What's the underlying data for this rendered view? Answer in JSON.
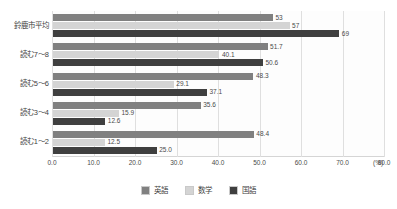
{
  "chart_data": {
    "type": "bar",
    "orientation": "horizontal",
    "title": "",
    "xlabel": "(%)",
    "ylabel": "",
    "xlim": [
      0.0,
      80.0
    ],
    "xticks": [
      "0.0",
      "10.0",
      "20.0",
      "30.0",
      "40.0",
      "50.0",
      "60.0",
      "70.0",
      "80.0"
    ],
    "xtick_values": [
      0.0,
      10.0,
      20.0,
      30.0,
      40.0,
      50.0,
      60.0,
      70.0,
      80.0
    ],
    "grid": true,
    "legend_position": "bottom",
    "categories": [
      "鈴鹿市平均",
      "読む7〜8",
      "読む5〜6",
      "読む3〜4",
      "読む1〜2"
    ],
    "series": [
      {
        "name": "英語",
        "color": "#808080",
        "values": [
          53,
          51.7,
          48.3,
          35.6,
          48.4
        ],
        "labels": [
          "53",
          "51.7",
          "48.3",
          "35.6",
          "48.4"
        ]
      },
      {
        "name": "数学",
        "color": "#d4d4d4",
        "values": [
          57,
          40.1,
          29.1,
          15.9,
          12.5
        ],
        "labels": [
          "57",
          "40.1",
          "29.1",
          "15.9",
          "12.5"
        ]
      },
      {
        "name": "国語",
        "color": "#3f3f3f",
        "values": [
          69,
          50.6,
          37.1,
          12.6,
          25.0
        ],
        "labels": [
          "69",
          "50.6",
          "37.1",
          "12.6",
          "25.0"
        ]
      }
    ]
  },
  "legend": {
    "items": [
      {
        "label": "英語",
        "color": "#808080"
      },
      {
        "label": "数学",
        "color": "#d4d4d4"
      },
      {
        "label": "国語",
        "color": "#3f3f3f"
      }
    ]
  },
  "axis": {
    "unit": "(%)"
  }
}
